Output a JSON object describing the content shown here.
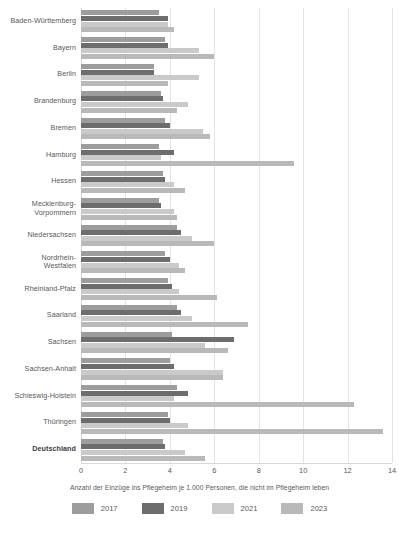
{
  "chart_data": {
    "type": "bar",
    "orientation": "horizontal",
    "title": "",
    "xlabel": "Anzahl der Einzüge ins Pflegeheim je 1.000 Personen, die nicht im Pflegeheim leben",
    "ylabel": "",
    "xlim": [
      0,
      14
    ],
    "xticks": [
      0,
      2,
      4,
      6,
      8,
      10,
      12,
      14
    ],
    "xtick_labels": [
      "0",
      "2",
      "4",
      "6",
      "8",
      "10",
      "12",
      "14"
    ],
    "grid": "vertical",
    "legend_position": "bottom",
    "categories": [
      "Baden-Württemberg",
      "Bayern",
      "Berlin",
      "Brandenburg",
      "Bremen",
      "Hamburg",
      "Hessen",
      "Mecklenburg-Vorpommern",
      "Niedersachsen",
      "Nordrhein-Westfalen",
      "Rheinland-Pfalz",
      "Saarland",
      "Sachsen",
      "Sachsen-Anhalt",
      "Schleswig-Holstein",
      "Thüringen",
      "Deutschland"
    ],
    "emphasized_category": "Deutschland",
    "series": [
      {
        "name": "2017",
        "color": "#9d9d9d",
        "values": [
          3.5,
          3.8,
          3.3,
          3.6,
          3.8,
          3.5,
          3.7,
          3.5,
          4.3,
          3.8,
          3.9,
          4.3,
          4.1,
          4.0,
          4.3,
          3.9,
          3.7
        ]
      },
      {
        "name": "2019",
        "color": "#6d6d6d",
        "values": [
          3.9,
          3.9,
          3.3,
          3.7,
          4.0,
          4.2,
          3.8,
          3.6,
          4.5,
          4.0,
          4.1,
          4.5,
          6.9,
          4.2,
          4.8,
          4.0,
          3.8
        ]
      },
      {
        "name": "2021",
        "color": "#cacaca",
        "values": [
          3.9,
          5.3,
          5.3,
          4.8,
          5.5,
          3.6,
          4.2,
          4.2,
          5.0,
          4.4,
          4.4,
          5.0,
          5.6,
          6.4,
          4.2,
          4.8,
          4.7
        ]
      },
      {
        "name": "2023",
        "color": "#b9b9b9",
        "values": [
          4.2,
          6.0,
          3.9,
          4.3,
          5.8,
          9.6,
          4.7,
          4.3,
          6.0,
          4.7,
          6.1,
          7.5,
          6.6,
          6.4,
          12.3,
          13.6,
          5.6
        ]
      }
    ]
  },
  "legend": {
    "items": [
      {
        "label": "2017",
        "key": "y2017"
      },
      {
        "label": "2019",
        "key": "y2019"
      },
      {
        "label": "2021",
        "key": "y2021"
      },
      {
        "label": "2023",
        "key": "y2023"
      }
    ]
  }
}
